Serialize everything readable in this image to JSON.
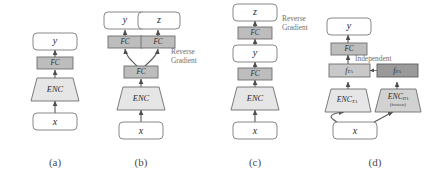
{
  "figure": {
    "colors": {
      "box_white_fill": "#ffffff",
      "fc_fill": "#bdbdbd",
      "f_light_fill": "#c9c9c9",
      "f_dark_fill": "#9a9a9a",
      "encoder_fill": "#e6e6e6",
      "encoder_dark_fill": "#d2d2d2",
      "stroke": "#6d6d6d",
      "annotation_text": "#6f6f6f",
      "caption_text": "#4a4a4a"
    },
    "panels": [
      {
        "id": "a",
        "caption": "(a)",
        "nodes": {
          "input": "x",
          "encoder": "ENC",
          "fc": "FC",
          "output": "y"
        },
        "annotations": []
      },
      {
        "id": "b",
        "caption": "(b)",
        "nodes": {
          "input": "x",
          "encoder": "ENC",
          "fc_shared": "FC",
          "fc_left": "FC",
          "fc_right": "FC",
          "output_left": "y",
          "output_right": "z"
        },
        "annotations": [
          {
            "name": "reverse-gradient",
            "line1": "Reverse",
            "line2": "Gradient"
          }
        ]
      },
      {
        "id": "c",
        "caption": "(c)",
        "nodes": {
          "input": "x",
          "encoder": "ENC",
          "fc_lower": "FC",
          "mid": "y",
          "fc_upper": "FC",
          "output": "z"
        },
        "annotations": [
          {
            "name": "reverse-gradient",
            "line1": "Reverse",
            "line2": "Gradient"
          }
        ]
      },
      {
        "id": "d",
        "caption": "(d)",
        "nodes": {
          "input": "x",
          "encoder_left": "ENC",
          "encoder_left_sub": "TA",
          "encoder_right": "ENC",
          "encoder_right_sub": "PA",
          "encoder_right_note": "(frozen)",
          "feature_left": "f",
          "feature_left_sub": "TA",
          "feature_right": "f",
          "feature_right_sub": "PA",
          "fc": "FC",
          "output": "y"
        },
        "annotations": [
          {
            "name": "independent",
            "line1": "Independent",
            "line2": ""
          }
        ]
      }
    ]
  }
}
